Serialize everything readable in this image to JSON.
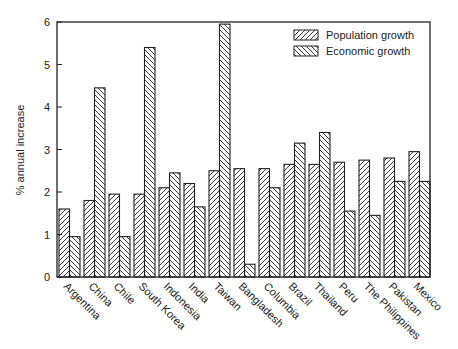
{
  "chart_data": {
    "type": "bar",
    "title": "",
    "xlabel": "",
    "ylabel": "% annual increase",
    "ylim": [
      0,
      6
    ],
    "yticks": [
      0,
      1,
      2,
      3,
      4,
      5,
      6
    ],
    "grid": false,
    "legend_position": "upper right (inside)",
    "categories": [
      "Argentina",
      "China",
      "Chile",
      "South Korea",
      "Indonesia",
      "India",
      "Taiwan",
      "Bangladesh",
      "Columbia",
      "Brazil",
      "Thailand",
      "Peru",
      "The Philippines",
      "Pakistan",
      "Mexico"
    ],
    "series": [
      {
        "name": "Population growth",
        "pattern": "hatch-forward",
        "values": [
          1.6,
          1.8,
          1.95,
          1.95,
          2.1,
          2.2,
          2.5,
          2.55,
          2.55,
          2.65,
          2.65,
          2.7,
          2.75,
          2.8,
          2.95
        ]
      },
      {
        "name": "Economic growth",
        "pattern": "hatch-backward",
        "values": [
          0.95,
          4.45,
          0.95,
          5.4,
          2.45,
          1.65,
          5.95,
          0.3,
          2.1,
          3.15,
          3.4,
          1.55,
          1.45,
          2.25,
          2.25
        ]
      }
    ]
  },
  "legend": {
    "items": [
      {
        "label": "Population growth"
      },
      {
        "label": "Economic growth"
      }
    ]
  },
  "colors": {
    "ink": "#222222",
    "background": "#ffffff"
  }
}
